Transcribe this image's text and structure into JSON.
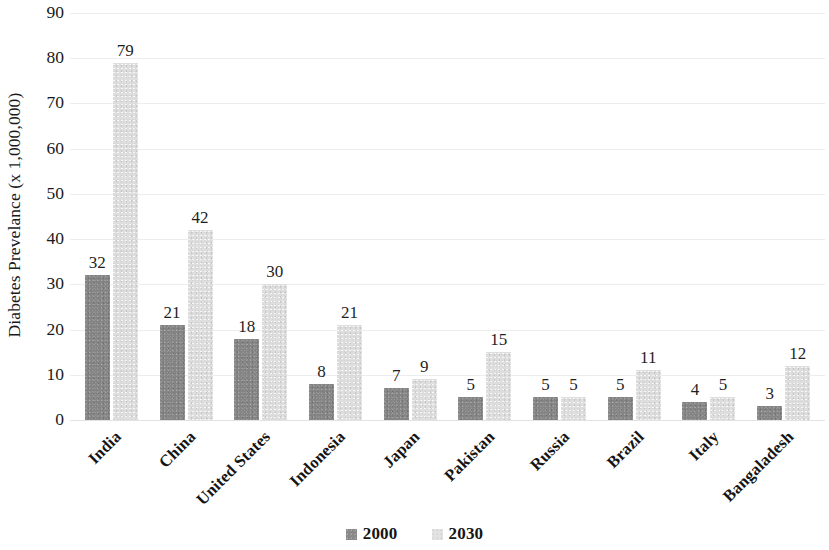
{
  "chart_data": {
    "type": "bar",
    "title": "",
    "subtitle": "",
    "xlabel": "",
    "ylabel": "Diabetes Prevelance (x 1,000,000)",
    "categories": [
      "India",
      "China",
      "United States",
      "Indonesia",
      "Japan",
      "Pakistan",
      "Russia",
      "Brazil",
      "Italy",
      "Bangaladesh"
    ],
    "series": [
      {
        "name": "2000",
        "color": "#848484",
        "values": [
          32,
          21,
          18,
          8,
          7,
          5,
          5,
          5,
          4,
          3
        ]
      },
      {
        "name": "2030",
        "color": "#dedede",
        "values": [
          79,
          42,
          30,
          21,
          9,
          15,
          5,
          11,
          5,
          12
        ]
      }
    ],
    "ylim": [
      0,
      90
    ],
    "ytick_step": 10,
    "yticks": [
      "90",
      "80",
      "70",
      "60",
      "50",
      "40",
      "30",
      "20",
      "10",
      "0"
    ],
    "grid": true,
    "grid_axis": "y",
    "legend_position": "bottom-center",
    "data_labels": true,
    "xtick_label_rotation": -45,
    "ylabel_rotation": -90,
    "background_color": "#ffffff",
    "gridline_color": "#ededed"
  },
  "legend": {
    "items": [
      {
        "label": "2000",
        "swatch": "series-2000-swatch"
      },
      {
        "label": "2030",
        "swatch": "series-2030-swatch"
      }
    ]
  }
}
